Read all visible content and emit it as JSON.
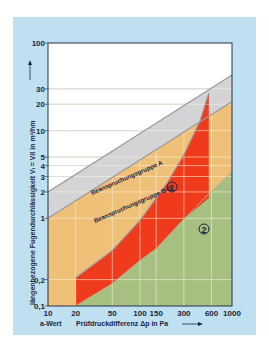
{
  "chart_data": {
    "type": "area",
    "title": "",
    "xlabel": "Prüfdruckdifferenz Δp in Pa",
    "xlabel_prefix": "a-Wert",
    "ylabel": "längenbezogene Fugendurchlässigkeit Vₗ = V/l in m³/hm",
    "xscale": "log",
    "yscale": "log",
    "xlim": [
      10,
      1000
    ],
    "ylim": [
      0.1,
      100
    ],
    "x_ticks": [
      10,
      20,
      50,
      100,
      150,
      300,
      600,
      1000
    ],
    "x_tick_labels": [
      "10",
      "20",
      "50",
      "100",
      "150",
      "300",
      "600",
      "1000"
    ],
    "y_ticks": [
      0.1,
      0.2,
      1,
      2,
      3,
      4,
      5,
      10,
      20,
      30,
      100
    ],
    "y_tick_labels": [
      "0,1",
      "0,2",
      "1",
      "2",
      "3",
      "4",
      "5",
      "10",
      "20",
      "30",
      "100"
    ],
    "grid": true,
    "series": [
      {
        "name": "Beanspruchungsgruppe A",
        "kind": "boundary_line",
        "formula": "V = 2 · (Δp/10)^(2/3)",
        "x": [
          10,
          1000
        ],
        "y": [
          2,
          43
        ]
      },
      {
        "name": "Beanspruchungsgruppe B-D",
        "kind": "boundary_line",
        "formula": "V = 1 · (Δp/10)^(2/3)",
        "x": [
          10,
          1000
        ],
        "y": [
          1,
          21.5
        ]
      },
      {
        "name": "Bereich 1",
        "label": "1",
        "kind": "region",
        "color": "#f03a1c",
        "upper_x": [
          20,
          50,
          100,
          150,
          200,
          300,
          450,
          560
        ],
        "upper_y": [
          0.21,
          0.43,
          0.95,
          1.7,
          2.6,
          5.3,
          13,
          27
        ],
        "lower_x": [
          20,
          50,
          100,
          150,
          300,
          560
        ],
        "lower_y": [
          0.1,
          0.18,
          0.33,
          0.45,
          0.98,
          1.7
        ],
        "right_edge_x": 560
      },
      {
        "name": "Bereich 2",
        "label": "2",
        "kind": "region",
        "color": "#a5c080",
        "upper_x": [
          20,
          50,
          100,
          150,
          300,
          560,
          1000
        ],
        "upper_y": [
          0.1,
          0.18,
          0.33,
          0.45,
          0.98,
          1.9,
          3.4
        ]
      }
    ],
    "annotations": [
      {
        "text": "Beanspruchungsgruppe A",
        "position": "along upper band"
      },
      {
        "text": "Beanspruchungsgruppe B-D",
        "position": "along lower band"
      },
      {
        "text": "1",
        "style": "circled",
        "x": 230,
        "y": 1.35
      },
      {
        "text": "2",
        "style": "circled",
        "x": 560,
        "y": 0.45
      }
    ],
    "colors": {
      "panel_bg": "#bfe0f0",
      "plot_bg": "#ffffff",
      "band_gray": "#d4d4d6",
      "band_edge": "#9a9a9e",
      "orange": "#eec078",
      "red": "#f03a1c",
      "green": "#a5c080",
      "grid_light": "#fbf2dc",
      "grid_dark": "#9a9aa0",
      "text": "#1c2540"
    }
  },
  "labels": {
    "band_a": "Beanspruchungsgruppe A",
    "band_bd": "Beanspruchungsgruppe B-D",
    "region1": "1",
    "region2": "2",
    "a_wert": "a-Wert",
    "xlabel": "Prüfdruckdifferenz Δp in Pa",
    "ylabel": "längenbezogene Fugendurchlässigkeit Vₗ = V/l in m³/hm"
  }
}
